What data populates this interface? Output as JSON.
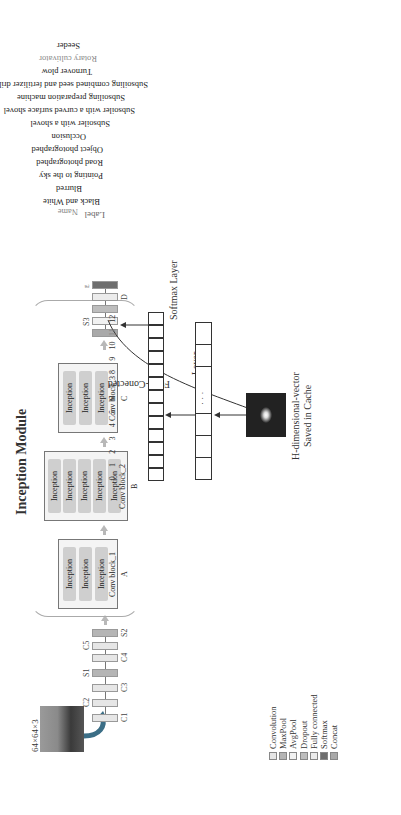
{
  "input": {
    "size_label": "64×64×3"
  },
  "front_stack": {
    "layers": [
      {
        "name": "C1",
        "type": "conv"
      },
      {
        "name": "C2",
        "type": "conv"
      },
      {
        "name": "C3",
        "type": "conv"
      },
      {
        "name": "S1",
        "type": "maxpool"
      },
      {
        "name": "C4",
        "type": "conv"
      },
      {
        "name": "C5",
        "type": "conv"
      },
      {
        "name": "S2",
        "type": "maxpool"
      }
    ]
  },
  "inception_module": {
    "title": "Inception Module",
    "blocks": [
      {
        "id": "A",
        "name": "Conv block_1",
        "items": [
          "Inception",
          "Inception",
          "Inception"
        ]
      },
      {
        "id": "B",
        "name": "Conv block_2",
        "items": [
          "Inception",
          "Inception",
          "Inception",
          "Inception",
          "Inception"
        ]
      },
      {
        "id": "C",
        "name": "Conv block_3",
        "items": [
          "Inception",
          "Inception",
          "Inception"
        ]
      }
    ]
  },
  "back_stack": {
    "layers": [
      {
        "name": "",
        "type": "concat"
      },
      {
        "name": "S3",
        "type": "avgpool"
      },
      {
        "name": "",
        "type": "dropout"
      },
      {
        "name": "D",
        "type": "fc"
      },
      {
        "name": "E",
        "type": "softmax"
      }
    ]
  },
  "feature": {
    "line1": "H-dimensional-vector",
    "line2": "Saved in Cache"
  },
  "fc_layer": {
    "label_line1": "Fully-Conected",
    "label_line2": "Layer",
    "dots": "·  ·  ·"
  },
  "softmax_layer": {
    "label": "Softmax Layer",
    "cells": 13
  },
  "classes": {
    "label_header": "Label",
    "name_header": "Name",
    "items": [
      {
        "label": "0",
        "name": "Black and White"
      },
      {
        "label": "1",
        "name": "Blurred"
      },
      {
        "label": "2",
        "name": "Pointing to the sky"
      },
      {
        "label": "3",
        "name": "Road photographed"
      },
      {
        "label": "4",
        "name": "Object photographed"
      },
      {
        "label": "5",
        "name": "Occlusion"
      },
      {
        "label": "6",
        "name": "Subsoiler with a shovel"
      },
      {
        "label": "7",
        "name": "Subsoiler with a curved surface shovel"
      },
      {
        "label": "8",
        "name": "Subsoiling preparation machine"
      },
      {
        "label": "9",
        "name": "Subsoiling combined seed and fertilizer drill"
      },
      {
        "label": "10",
        "name": "Turnover plow"
      },
      {
        "label": "11",
        "name": "Rotary cultivator"
      },
      {
        "label": "12",
        "name": "Seeder"
      }
    ],
    "highlighted_index": 11
  },
  "legend": {
    "items": [
      {
        "label": "Convolution",
        "color": "#e6e6e6"
      },
      {
        "label": "MaxPool",
        "color": "#b5b5b5"
      },
      {
        "label": "AvgPool",
        "color": "#f2f2f2"
      },
      {
        "label": "Dropout",
        "color": "#bdbdbd"
      },
      {
        "label": "Fully connected",
        "color": "#ececec"
      },
      {
        "label": "Softmax",
        "color": "#6e6e6e"
      },
      {
        "label": "Concat",
        "color": "#a9a9a9"
      }
    ]
  }
}
